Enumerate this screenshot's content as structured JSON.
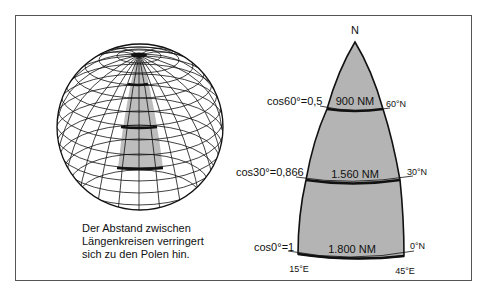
{
  "figure": {
    "caption_lines": [
      "Der Abstand zwischen",
      "Längenkreisen verringert",
      "sich zu den Polen hin."
    ],
    "globe": {
      "description": "Globe with graticule; shaded meridian band between two meridians, thick parallels at 0°, 30°, 60°N"
    },
    "segment": {
      "apex_label": "N",
      "parallels": [
        {
          "cos_label": "cos60°=0,5",
          "distance_label": "900 NM",
          "lat_label": "60°N"
        },
        {
          "cos_label": "cos30°=0,866",
          "distance_label": "1.560 NM",
          "lat_label": "30°N"
        },
        {
          "cos_label": "cos0°=1",
          "distance_label": "1.800 NM",
          "lat_label": "0°N"
        }
      ],
      "longitudes": {
        "left": "15°E",
        "right": "45°E"
      }
    },
    "colors": {
      "shade": "#b4b4b4",
      "line": "#111111",
      "frame": "#555555"
    }
  }
}
